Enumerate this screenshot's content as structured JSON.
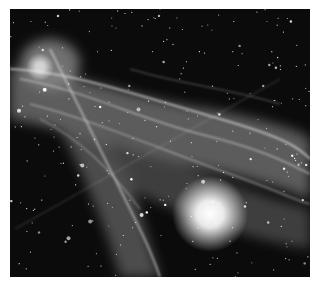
{
  "image": {
    "subject": "nebula-photograph",
    "description": "Grayscale astronomical photograph of a filamentary nebula with a dense star field and a bright star in the lower right",
    "palette": {
      "background": "#0a0a0a",
      "nebula": "#bdbdbd",
      "stars": "#ffffff",
      "border": "#ffffff"
    }
  }
}
